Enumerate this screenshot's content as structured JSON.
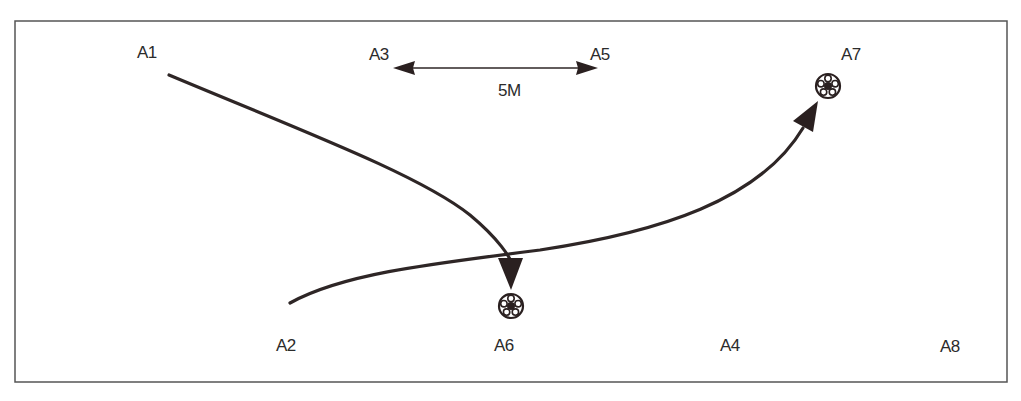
{
  "diagram": {
    "title": "",
    "frame": {
      "x": 15,
      "y": 21,
      "width": 992,
      "height": 361,
      "stroke": "#555555"
    },
    "colors": {
      "line": "#2e2626",
      "text": "#2b2b2b",
      "arrow": "#2a2020"
    },
    "markers": [
      {
        "id": "A1",
        "label": "A1",
        "x": 137,
        "y": 44
      },
      {
        "id": "A2",
        "label": "A2",
        "x": 276,
        "y": 337
      },
      {
        "id": "A3",
        "label": "A3",
        "x": 369,
        "y": 46
      },
      {
        "id": "A4",
        "label": "A4",
        "x": 720,
        "y": 337
      },
      {
        "id": "A5",
        "label": "A5",
        "x": 590,
        "y": 46
      },
      {
        "id": "A6",
        "label": "A6",
        "x": 494,
        "y": 337
      },
      {
        "id": "A7",
        "label": "A7",
        "x": 841,
        "y": 46
      },
      {
        "id": "A8",
        "label": "A8",
        "x": 940,
        "y": 338
      }
    ],
    "balls": [
      {
        "id": "ball-at-A6",
        "cx": 511,
        "cy": 306,
        "r": 12
      },
      {
        "id": "ball-at-A7",
        "cx": 828,
        "cy": 86,
        "r": 12
      }
    ],
    "distance": {
      "label": "5M",
      "from": "A3",
      "to": "A5",
      "x1": 393,
      "x2": 598,
      "y": 68,
      "label_x": 498,
      "label_y": 82
    },
    "paths": [
      {
        "id": "run-A1-to-A6",
        "from": "A1",
        "to": "A6",
        "d": "M169,75 C300,130 420,175 470,215 C500,240 510,260 511,262"
      },
      {
        "id": "pass-A2-to-A7",
        "from": "A2",
        "to": "A7",
        "d": "M290,303 C340,275 420,265 540,250 C660,232 760,200 805,125"
      }
    ]
  }
}
